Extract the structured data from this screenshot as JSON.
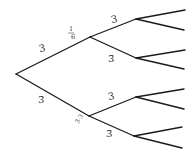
{
  "diagram": {
    "type": "binary-tree",
    "orientation": "left-to-right",
    "levels": 3,
    "line_color": "#1a1a1a",
    "nodes": {
      "root": {
        "x": 16,
        "y": 74
      },
      "upper_mid": {
        "x": 90,
        "y": 37
      },
      "lower_mid": {
        "x": 89,
        "y": 116
      },
      "level2": [
        {
          "x": 136,
          "y": 19
        },
        {
          "x": 136,
          "y": 58
        },
        {
          "x": 136,
          "y": 97
        },
        {
          "x": 134,
          "y": 136
        }
      ],
      "leaves": [
        {
          "x": 185,
          "y": 10
        },
        {
          "x": 184,
          "y": 30
        },
        {
          "x": 185,
          "y": 50
        },
        {
          "x": 184,
          "y": 69
        },
        {
          "x": 184,
          "y": 89
        },
        {
          "x": 184,
          "y": 109
        },
        {
          "x": 182,
          "y": 127
        },
        {
          "x": 182,
          "y": 148
        }
      ]
    },
    "labels": {
      "root_upper": "3",
      "upper_mid_fraction_num": "1",
      "upper_mid_fraction_den": "6",
      "upper_upper": "3",
      "upper_lower": "3̄",
      "root_lower": "3̄",
      "lower_mid_mark": "3̄·3",
      "lower_upper": "3",
      "lower_lower": "3̄"
    }
  }
}
